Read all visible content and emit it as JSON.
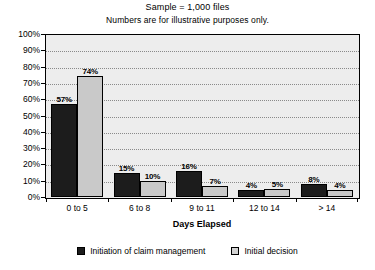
{
  "chart_data": {
    "type": "bar",
    "title": "Sample = 1,000 files",
    "subtitle": "Numbers are for illustrative purposes only.",
    "xlabel": "Days Elapsed",
    "ylabel": "",
    "ylim": [
      0,
      100
    ],
    "grid": true,
    "legend_position": "bottom",
    "categories": [
      "0 to 5",
      "6 to 8",
      "9 to 11",
      "12 to 14",
      "> 14"
    ],
    "ytick_labels": [
      "100%",
      "90%",
      "80%",
      "70%",
      "60%",
      "50%",
      "40%",
      "30%",
      "20%",
      "10%",
      "0%"
    ],
    "ytick_values": [
      100,
      90,
      80,
      70,
      60,
      50,
      40,
      30,
      20,
      10,
      0
    ],
    "series": [
      {
        "name": "Initiation of claim management",
        "color": "#1c1c1c",
        "values": [
          57,
          15,
          16,
          4,
          8
        ],
        "labels": [
          "57%",
          "15%",
          "16%",
          "4%",
          "8%"
        ]
      },
      {
        "name": "Initial decision",
        "color": "#c9c9c9",
        "values": [
          74,
          10,
          7,
          5,
          4
        ],
        "labels": [
          "74%",
          "10%",
          "7%",
          "5%",
          "4%"
        ]
      }
    ]
  }
}
